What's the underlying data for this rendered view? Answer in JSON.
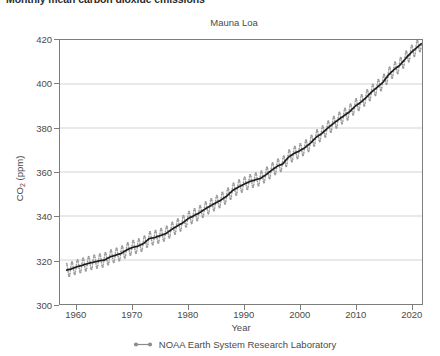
{
  "title": "Monthly mean carbon dioxide emissions",
  "subtitle": "Mauna Loa",
  "axis": {
    "x_title": "Year",
    "y_title_main": "CO",
    "y_title_sub": "2",
    "y_title_unit": " (ppm)"
  },
  "legend": {
    "label": "NOAA Earth System Research Laboratory",
    "symbol": "line-with-dot-markers",
    "color": "#8c8c8c"
  },
  "colors": {
    "monthly_series": "#9a9a9a",
    "trend_series": "#1c1c1c",
    "grid": "#c8c8c8",
    "frame": "#7d7d7d",
    "text": "#4a4a4a",
    "title": "#2b2b2b"
  },
  "chart_data": {
    "type": "line",
    "title": "Monthly mean carbon dioxide emissions",
    "subtitle": "Mauna Loa",
    "xlabel": "Year",
    "ylabel": "CO2 (ppm)",
    "xlim": [
      1957.0,
      2022.0
    ],
    "ylim": [
      300,
      420
    ],
    "xticks": [
      1960,
      1970,
      1980,
      1990,
      2000,
      2010,
      2020
    ],
    "yticks": [
      300,
      320,
      340,
      360,
      380,
      400,
      420
    ],
    "gridlines_y": [
      320,
      340,
      360,
      380,
      400
    ],
    "grid": "horizontal",
    "legend_position": "bottom-center",
    "seasonal_amplitude_ppm": 3.1,
    "series": [
      {
        "name": "Monthly mean",
        "style": "markers-zigzag",
        "color": "#9a9a9a",
        "note": "monthly values = annual trend + seasonal cycle, peak in May, minimum in September"
      },
      {
        "name": "NOAA Earth System Research Laboratory",
        "style": "trend-line",
        "color": "#1c1c1c",
        "x": [
          1958,
          1959,
          1960,
          1961,
          1962,
          1963,
          1964,
          1965,
          1966,
          1967,
          1968,
          1969,
          1970,
          1971,
          1972,
          1973,
          1974,
          1975,
          1976,
          1977,
          1978,
          1979,
          1980,
          1981,
          1982,
          1983,
          1984,
          1985,
          1986,
          1987,
          1988,
          1989,
          1990,
          1991,
          1992,
          1993,
          1994,
          1995,
          1996,
          1997,
          1998,
          1999,
          2000,
          2001,
          2002,
          2003,
          2004,
          2005,
          2006,
          2007,
          2008,
          2009,
          2010,
          2011,
          2012,
          2013,
          2014,
          2015,
          2016,
          2017,
          2018,
          2019,
          2020,
          2021,
          2022
        ],
        "values": [
          315.3,
          315.9,
          316.9,
          317.6,
          318.4,
          319.0,
          319.6,
          320.0,
          321.4,
          322.2,
          323.0,
          324.6,
          325.7,
          326.3,
          327.5,
          329.7,
          330.2,
          331.1,
          332.0,
          333.8,
          335.4,
          336.8,
          338.8,
          340.1,
          341.4,
          343.1,
          344.6,
          346.0,
          347.4,
          349.2,
          351.6,
          353.1,
          354.4,
          355.6,
          356.4,
          357.1,
          358.8,
          360.8,
          362.6,
          363.7,
          366.7,
          368.4,
          369.6,
          371.1,
          373.2,
          375.8,
          377.5,
          379.8,
          381.9,
          383.8,
          385.6,
          387.4,
          389.9,
          391.7,
          393.9,
          396.5,
          398.6,
          400.8,
          404.2,
          406.6,
          408.5,
          411.4,
          414.2,
          416.4,
          418.6
        ]
      }
    ]
  }
}
